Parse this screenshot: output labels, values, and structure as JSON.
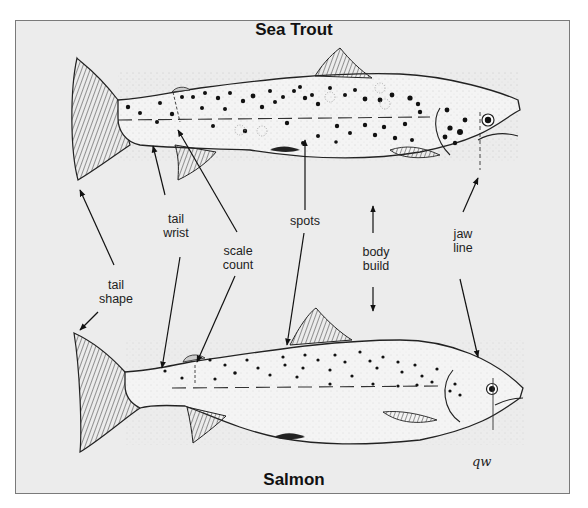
{
  "diagram": {
    "frame_background": "#ececec",
    "frame_border": "#7a7a7a",
    "titles": {
      "top": "Sea Trout",
      "bottom": "Salmon"
    },
    "labels": [
      {
        "id": "tail-shape",
        "line1": "tail",
        "line2": "shape"
      },
      {
        "id": "tail-wrist",
        "line1": "tail",
        "line2": "wrist"
      },
      {
        "id": "scale-count",
        "line1": "scale",
        "line2": "count"
      },
      {
        "id": "spots",
        "line1": "spots",
        "line2": ""
      },
      {
        "id": "body-build",
        "line1": "body",
        "line2": "build"
      },
      {
        "id": "jaw-line",
        "line1": "jaw",
        "line2": "line"
      }
    ],
    "signature": "qw"
  }
}
